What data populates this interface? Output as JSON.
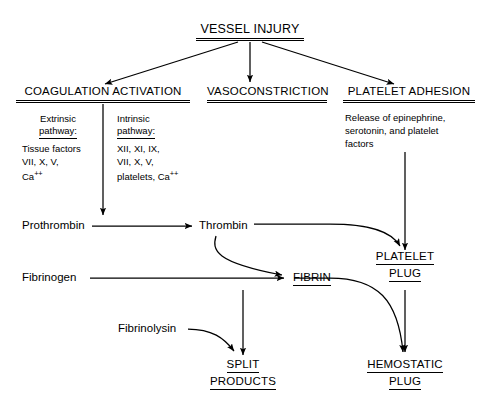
{
  "diagram": {
    "ink_color": "#000000",
    "background_color": "#ffffff"
  },
  "nodes": {
    "vessel_injury": "VESSEL INJURY",
    "coagulation_activation": "COAGULATION ACTIVATION",
    "vasoconstriction": "VASOCONSTRICTION",
    "platelet_adhesion": "PLATELET ADHESION",
    "extrinsic_title_line1": "Extrinsic",
    "extrinsic_title_line2": "pathway:",
    "extrinsic_factors_line1": "Tissue factors",
    "extrinsic_factors_line2": "VII, X, V,",
    "extrinsic_factors_line3_base": "Ca",
    "extrinsic_factors_line3_sup": "++",
    "intrinsic_title_line1": "Intrinsic",
    "intrinsic_title_line2": "pathway:",
    "intrinsic_factors_line1": "XII, XI, IX,",
    "intrinsic_factors_line2": "VII, X, V,",
    "intrinsic_factors_line3_base": "platelets, Ca",
    "intrinsic_factors_line3_sup": "++",
    "platelet_release_line1": "Release of epinephrine,",
    "platelet_release_line2": "serotonin, and platelet",
    "platelet_release_line3": "factors",
    "prothrombin": "Prothrombin",
    "thrombin": "Thrombin",
    "fibrinogen": "Fibrinogen",
    "fibrin": "FIBRIN",
    "fibrinolysin": "Fibrinolysin",
    "platelet_plug_line1": "PLATELET",
    "platelet_plug_line2": "PLUG",
    "split_products_line1": "SPLIT",
    "split_products_line2": "PRODUCTS",
    "hemostatic_plug_line1": "HEMOSTATIC",
    "hemostatic_plug_line2": "PLUG"
  },
  "edges": [
    {
      "id": "injury-to-coagulation",
      "from": "VESSEL INJURY",
      "to": "COAGULATION ACTIVATION",
      "style": "straight-diagonal"
    },
    {
      "id": "injury-to-vasoconstriction",
      "from": "VESSEL INJURY",
      "to": "VASOCONSTRICTION",
      "style": "straight-vertical"
    },
    {
      "id": "injury-to-platelet-adhesion",
      "from": "VESSEL INJURY",
      "to": "PLATELET ADHESION",
      "style": "straight-diagonal"
    },
    {
      "id": "coagulation-to-prothrombin",
      "from": "COAGULATION ACTIVATION",
      "to": "Prothrombin",
      "style": "straight-vertical"
    },
    {
      "id": "prothrombin-to-thrombin",
      "from": "Prothrombin",
      "to": "Thrombin",
      "style": "straight-horizontal"
    },
    {
      "id": "thrombin-to-fibrin",
      "from": "Thrombin",
      "to": "FIBRIN",
      "style": "curved"
    },
    {
      "id": "thrombin-to-platelet-plug",
      "from": "Thrombin",
      "to": "PLATELET PLUG",
      "style": "curved"
    },
    {
      "id": "fibrinogen-to-fibrin",
      "from": "Fibrinogen",
      "to": "FIBRIN",
      "style": "straight-horizontal"
    },
    {
      "id": "platelet-adhesion-to-platelet-plug",
      "from": "PLATELET ADHESION",
      "to": "PLATELET PLUG",
      "style": "straight-vertical"
    },
    {
      "id": "fibrin-to-split-products",
      "from": "FIBRIN",
      "to": "SPLIT PRODUCTS",
      "style": "straight-vertical"
    },
    {
      "id": "fibrinolysin-to-split-products",
      "from": "Fibrinolysin",
      "to": "SPLIT PRODUCTS",
      "style": "curved"
    },
    {
      "id": "fibrin-to-hemostatic-plug",
      "from": "FIBRIN",
      "to": "HEMOSTATIC PLUG",
      "style": "curved"
    },
    {
      "id": "platelet-plug-to-hemostatic-plug",
      "from": "PLATELET PLUG",
      "to": "HEMOSTATIC PLUG",
      "style": "straight-vertical"
    }
  ]
}
